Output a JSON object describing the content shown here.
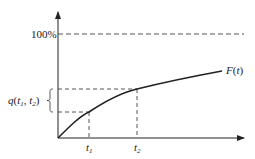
{
  "diagram": {
    "type": "cumulative-function-plot",
    "y_axis": {
      "reference_label": "100%"
    },
    "x_axis": {
      "ticks": [
        {
          "name": "t1",
          "base": "t",
          "sub": "1"
        },
        {
          "name": "t2",
          "base": "t",
          "sub": "2"
        }
      ]
    },
    "curve": {
      "label_func": "F",
      "label_arg": "t",
      "label_full": "F(t)"
    },
    "interval_label": {
      "func": "q",
      "open": "(",
      "a": "t",
      "a_sub": "1",
      "sep": ", ",
      "b": "t",
      "b_sub": "2",
      "close": ")",
      "full": "q(t1, t2)"
    },
    "colors": {
      "line": "#222222",
      "dashed": "#444444",
      "background": "#ffffff"
    }
  }
}
